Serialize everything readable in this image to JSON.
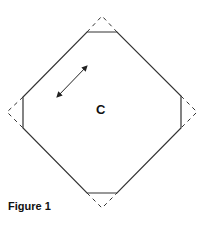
{
  "figure": {
    "caption": "Figure 1",
    "region_label": "C",
    "shape": "octagon-with-truncated-corners",
    "colors": {
      "stroke": "#333333",
      "background": "#ffffff"
    },
    "octagon_points": [
      [
        87,
        32
      ],
      [
        117,
        32
      ],
      [
        181,
        96
      ],
      [
        181,
        128
      ],
      [
        117,
        193
      ],
      [
        87,
        193
      ],
      [
        23,
        128
      ],
      [
        23,
        97
      ]
    ],
    "dashed_corners": [
      {
        "name": "top",
        "points": [
          [
            87,
            32
          ],
          [
            102,
            16
          ],
          [
            117,
            32
          ]
        ]
      },
      {
        "name": "right",
        "points": [
          [
            181,
            96
          ],
          [
            197,
            112
          ],
          [
            181,
            128
          ]
        ]
      },
      {
        "name": "bottom",
        "points": [
          [
            87,
            193
          ],
          [
            102,
            208
          ],
          [
            117,
            193
          ]
        ]
      },
      {
        "name": "left",
        "points": [
          [
            23,
            97
          ],
          [
            7,
            112
          ],
          [
            23,
            128
          ]
        ]
      }
    ],
    "arrow": {
      "from": [
        56,
        98
      ],
      "to": [
        88,
        65
      ],
      "double_headed": true
    }
  }
}
